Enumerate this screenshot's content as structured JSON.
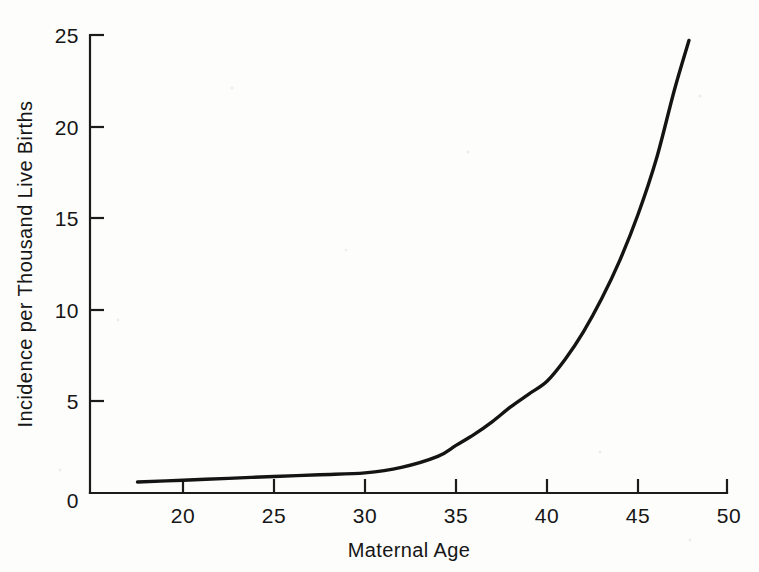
{
  "figure": {
    "background_color": "#fdfdfb",
    "ink_color": "#141414"
  },
  "chart_data": {
    "type": "line",
    "title": "",
    "subtitle": "",
    "xlabel": "Maternal Age",
    "ylabel": "Incidence per Thousand Live Births",
    "xlim": [
      15,
      50
    ],
    "ylim": [
      0,
      25
    ],
    "xticks": [
      20,
      25,
      30,
      35,
      40,
      45,
      50
    ],
    "xticklabels": [
      "20",
      "25",
      "30",
      "35",
      "40",
      "45",
      "50"
    ],
    "yticks": [
      0,
      5,
      10,
      15,
      20,
      25
    ],
    "yticklabels": [
      "0",
      "5",
      "10",
      "15",
      "20",
      "25"
    ],
    "grid": false,
    "legend": null,
    "annotations": [],
    "series": [
      {
        "name": "Incidence",
        "x": [
          17.5,
          20,
          22.5,
          25,
          27.5,
          30,
          32,
          34,
          35,
          36,
          37,
          38,
          39,
          40,
          41,
          42,
          43,
          44,
          45,
          46,
          47,
          47.8
        ],
        "y": [
          0.6,
          0.7,
          0.8,
          0.9,
          1.0,
          1.1,
          1.4,
          2.0,
          2.6,
          3.2,
          3.9,
          4.7,
          5.4,
          6.1,
          7.3,
          8.8,
          10.6,
          12.7,
          15.2,
          18.2,
          22.0,
          24.7
        ]
      }
    ]
  },
  "axes": {
    "x_tick_count": 7,
    "y_tick_count": 6
  }
}
